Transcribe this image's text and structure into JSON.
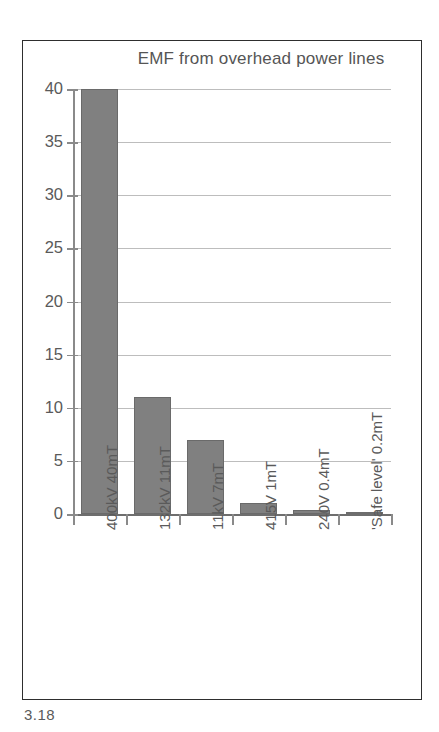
{
  "figure": {
    "caption": "3.18"
  },
  "chart_data": {
    "type": "bar",
    "title": "EMF from overhead power lines",
    "xlabel": "",
    "ylabel": "",
    "ylim": [
      0,
      40
    ],
    "yticks": [
      0,
      5,
      10,
      15,
      20,
      25,
      30,
      35,
      40
    ],
    "ytick_labels": [
      "0",
      "5",
      "10",
      "15",
      "20",
      "25",
      "30",
      "35",
      "40"
    ],
    "grid": true,
    "legend": "none",
    "bar_color": "#808080",
    "categories": [
      "400kV  40mT",
      "132kV  11mT",
      "11kV  7mT",
      "415V  1mT",
      "240V  0.4mT",
      "'Safe level'  0.2mT"
    ],
    "values": [
      40,
      11,
      7,
      1,
      0.4,
      0.2
    ]
  }
}
